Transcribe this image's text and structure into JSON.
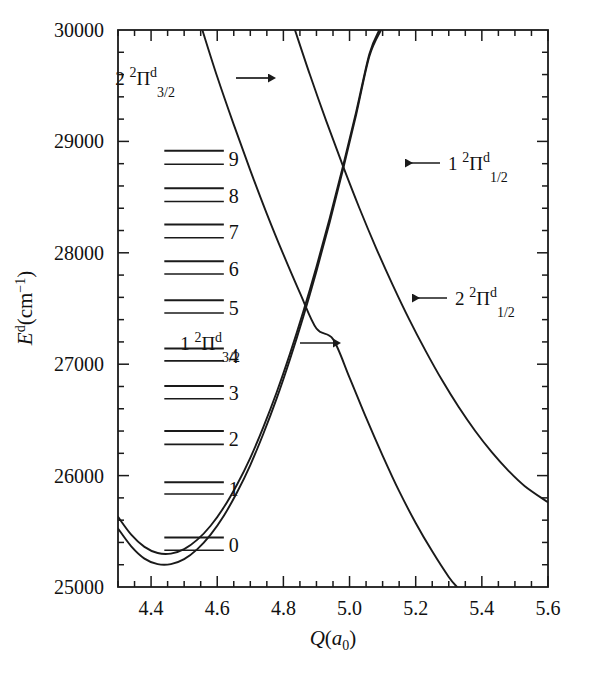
{
  "figure": {
    "background": "#ffffff",
    "line_color": "#1a1a1a"
  },
  "chart_data": {
    "type": "line",
    "title": "",
    "xlabel": "Q(a0)",
    "ylabel": "Ed(cm-1)",
    "xlim": [
      4.3,
      5.6
    ],
    "ylim": [
      25000,
      30000
    ],
    "grid": false,
    "legend_position": "inline-annotations",
    "x_ticks_major": [
      4.4,
      4.6,
      4.8,
      5.0,
      5.2,
      5.4,
      5.6
    ],
    "x_tick_labels": [
      "4.4",
      "4.6",
      "4.8",
      "5.0",
      "5.2",
      "5.4",
      "5.6"
    ],
    "x_tick_minor_step": 0.05,
    "y_ticks_major": [
      25000,
      26000,
      27000,
      28000,
      29000,
      30000
    ],
    "y_tick_labels": [
      "25000",
      "26000",
      "27000",
      "28000",
      "29000",
      "30000"
    ],
    "y_tick_minor_step": 200,
    "series": [
      {
        "name": "1 2Pi d 3/2",
        "label_text": "1 2Pid3/2",
        "kind": "bound-well",
        "points": [
          [
            4.3,
            25630
          ],
          [
            4.34,
            25470
          ],
          [
            4.38,
            25360
          ],
          [
            4.42,
            25305
          ],
          [
            4.46,
            25300
          ],
          [
            4.5,
            25340
          ],
          [
            4.54,
            25425
          ],
          [
            4.58,
            25550
          ],
          [
            4.62,
            25715
          ],
          [
            4.66,
            25920
          ],
          [
            4.7,
            26160
          ],
          [
            4.74,
            26440
          ],
          [
            4.78,
            26750
          ],
          [
            4.82,
            27095
          ],
          [
            4.86,
            27470
          ],
          [
            4.9,
            27875
          ],
          [
            4.94,
            28310
          ],
          [
            4.98,
            28775
          ],
          [
            5.02,
            29265
          ],
          [
            5.06,
            29785
          ],
          [
            5.09,
            30000
          ]
        ]
      },
      {
        "name": "1 2Pi d 1/2",
        "label_text": "1 2Pid1/2",
        "kind": "bound-well",
        "points": [
          [
            4.3,
            25525
          ],
          [
            4.34,
            25365
          ],
          [
            4.38,
            25255
          ],
          [
            4.42,
            25205
          ],
          [
            4.46,
            25205
          ],
          [
            4.5,
            25250
          ],
          [
            4.54,
            25340
          ],
          [
            4.58,
            25470
          ],
          [
            4.62,
            25640
          ],
          [
            4.66,
            25850
          ],
          [
            4.7,
            26095
          ],
          [
            4.74,
            26380
          ],
          [
            4.78,
            26695
          ],
          [
            4.82,
            27045
          ],
          [
            4.86,
            27425
          ],
          [
            4.9,
            27835
          ],
          [
            4.94,
            28275
          ],
          [
            4.98,
            28745
          ],
          [
            5.02,
            29240
          ],
          [
            5.06,
            29765
          ],
          [
            5.095,
            30000
          ]
        ]
      },
      {
        "name": "2 2Pi d 3/2",
        "label_text": "2 2Pid3/2",
        "kind": "repulsive",
        "points": [
          [
            4.555,
            30000
          ],
          [
            4.6,
            29580
          ],
          [
            4.65,
            29150
          ],
          [
            4.7,
            28740
          ],
          [
            4.75,
            28350
          ],
          [
            4.8,
            27985
          ],
          [
            4.85,
            27640
          ],
          [
            4.9,
            27320
          ],
          [
            4.95,
            27225
          ],
          [
            5.0,
            26880
          ],
          [
            5.05,
            26520
          ],
          [
            5.1,
            26180
          ],
          [
            5.15,
            25860
          ],
          [
            5.2,
            25575
          ],
          [
            5.25,
            25320
          ],
          [
            5.3,
            25090
          ],
          [
            5.325,
            25000
          ]
        ]
      },
      {
        "name": "2 2Pi d 1/2",
        "label_text": "2 2Pid1/2",
        "kind": "repulsive",
        "points": [
          [
            4.835,
            30000
          ],
          [
            4.88,
            29600
          ],
          [
            4.93,
            29180
          ],
          [
            4.98,
            28780
          ],
          [
            5.03,
            28400
          ],
          [
            5.08,
            28045
          ],
          [
            5.13,
            27715
          ],
          [
            5.18,
            27405
          ],
          [
            5.23,
            27120
          ],
          [
            5.28,
            26855
          ],
          [
            5.33,
            26615
          ],
          [
            5.38,
            26400
          ],
          [
            5.43,
            26210
          ],
          [
            5.48,
            26045
          ],
          [
            5.53,
            25905
          ],
          [
            5.6,
            25760
          ]
        ]
      }
    ],
    "crossings": [
      {
        "q": 5.11,
        "e": 28440
      },
      {
        "q": 4.95,
        "e": 27230
      }
    ],
    "vibrational_levels": {
      "description": "Doublet vibrational levels of the 1 2Pid state",
      "x_start": 4.44,
      "x_end": 4.62,
      "levels": [
        {
          "v": "0",
          "upper": 25445,
          "lower": 25330
        },
        {
          "v": "1",
          "upper": 25940,
          "lower": 25835
        },
        {
          "v": "2",
          "upper": 26400,
          "lower": 26280
        },
        {
          "v": "3",
          "upper": 26805,
          "lower": 26690
        },
        {
          "v": "4",
          "upper": 27140,
          "lower": 27030
        },
        {
          "v": "5",
          "upper": 27575,
          "lower": 27460
        },
        {
          "v": "6",
          "upper": 27925,
          "lower": 27810
        },
        {
          "v": "7",
          "upper": 28255,
          "lower": 28135
        },
        {
          "v": "8",
          "upper": 28580,
          "lower": 28460
        },
        {
          "v": "9",
          "upper": 28915,
          "lower": 28795
        }
      ]
    },
    "annotations": [
      {
        "id": "ann-2pi32",
        "prefix": "2",
        "sup_left": "2",
        "glyph": "Π",
        "sup_right": "d",
        "sub": "3/2",
        "arrow": "right",
        "text_x": 175,
        "text_y": 85,
        "arrow_from": [
          236,
          78
        ],
        "arrow_to": [
          268,
          78
        ]
      },
      {
        "id": "ann-1pi32",
        "prefix": "1",
        "sup_left": "2",
        "glyph": "Π",
        "sup_right": "d",
        "sub": "3/2",
        "arrow": "right",
        "text_x": 240,
        "text_y": 350,
        "arrow_from": [
          300,
          343
        ],
        "arrow_to": [
          333,
          343
        ]
      },
      {
        "id": "ann-1pi12",
        "prefix": "1",
        "sup_left": "2",
        "glyph": "Π",
        "sup_right": "d",
        "sub": "1/2",
        "arrow": "left",
        "text_x": 448,
        "text_y": 170,
        "arrow_from": [
          440,
          163
        ],
        "arrow_to": [
          405,
          163
        ]
      },
      {
        "id": "ann-2pi12",
        "prefix": "2",
        "sup_left": "2",
        "glyph": "Π",
        "sup_right": "d",
        "sub": "1/2",
        "arrow": "left",
        "text_x": 455,
        "text_y": 305,
        "arrow_from": [
          447,
          298
        ],
        "arrow_to": [
          412,
          298
        ]
      }
    ]
  },
  "axes": {
    "x_title_ital": "Q",
    "x_title_paren_open": "(",
    "x_title_a": "a",
    "x_title_sub": "0",
    "x_title_paren_close": ")",
    "y_title_ital": "E",
    "y_title_sup": "d",
    "y_title_rest": "(cm",
    "y_title_sup2": "−1",
    "y_title_end": ")"
  }
}
